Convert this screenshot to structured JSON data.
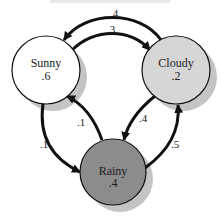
{
  "diagram": {
    "type": "markov-chain",
    "colors": {
      "sunny_fill": "#ffffff",
      "cloudy_fill": "#d6d6d6",
      "rainy_fill": "#8c8c8c",
      "shadow": "#c4c4c4",
      "edge": "#111111"
    },
    "states": [
      {
        "id": "sunny",
        "name": "Sunny",
        "prob": ".6"
      },
      {
        "id": "cloudy",
        "name": "Cloudy",
        "prob": ".2"
      },
      {
        "id": "rainy",
        "name": "Rainy",
        "prob": ".4"
      }
    ],
    "transitions": [
      {
        "from": "Cloudy",
        "to": "Sunny",
        "label": ".4"
      },
      {
        "from": "Sunny",
        "to": "Cloudy",
        "label": ".3"
      },
      {
        "from": "Sunny",
        "to": "Rainy",
        "label": ".1"
      },
      {
        "from": "Rainy",
        "to": "Sunny",
        "label": ".1"
      },
      {
        "from": "Cloudy",
        "to": "Rainy",
        "label": ".4"
      },
      {
        "from": "Rainy",
        "to": "Cloudy",
        "label": ".5"
      }
    ]
  }
}
